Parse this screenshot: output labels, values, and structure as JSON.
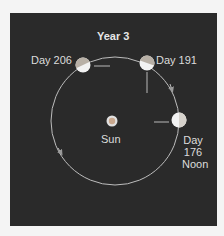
{
  "diagram": {
    "title": "Year 3",
    "center_label": "Sun",
    "positions": [
      {
        "id": "day-206",
        "label": "Day 206"
      },
      {
        "id": "day-191",
        "label": "Day 191"
      },
      {
        "id": "day-176",
        "label_lines": [
          "Day",
          "176",
          "Noon"
        ]
      }
    ],
    "colors": {
      "background": "#2a2a2a",
      "orbit": "#bdbdbd",
      "planet_lit": "#f2f2f2",
      "planet_dark": "#b8b0a6",
      "arrow": "#8a8a8a",
      "sun_core": "#c9a88e",
      "sun_ring": "#e0e0e0",
      "text": "#dcdcdc"
    }
  }
}
